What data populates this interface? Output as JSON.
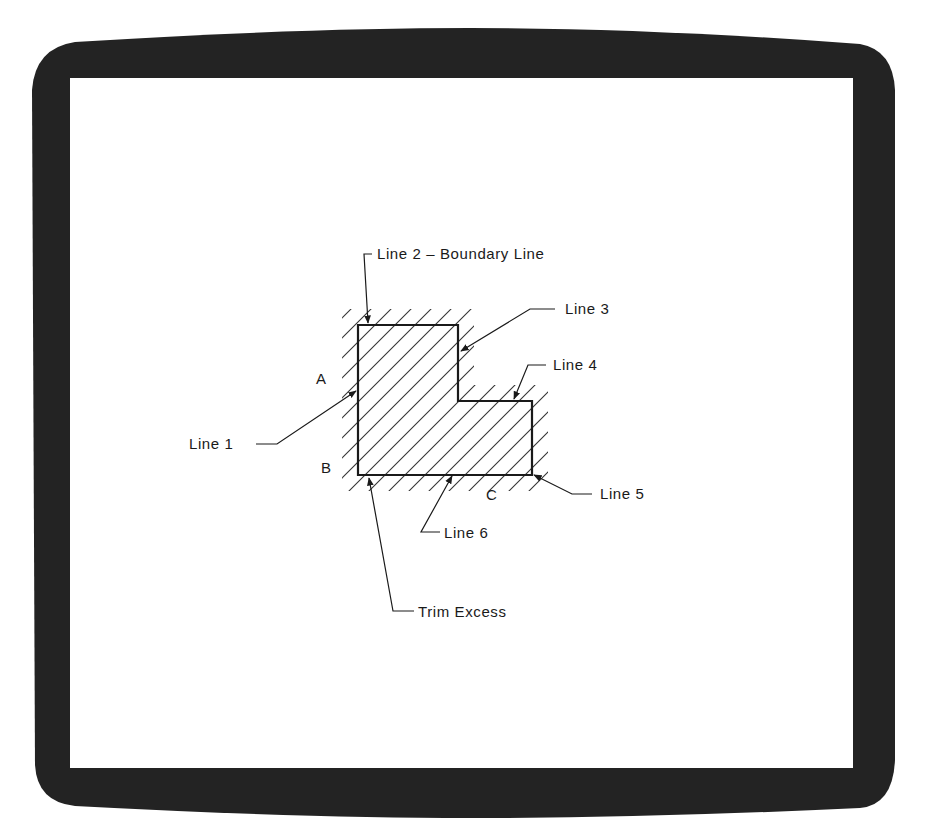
{
  "colors": {
    "frame": "#232323",
    "screen": "#ffffff",
    "ink": "#1a1a1a",
    "hatch": "#333333"
  },
  "diagram": {
    "title": "",
    "shape": {
      "description": "L-shaped boundary with diagonal hatch fill",
      "points": [
        [
          358,
          325
        ],
        [
          458,
          325
        ],
        [
          458,
          401
        ],
        [
          532,
          401
        ],
        [
          532,
          475
        ],
        [
          358,
          475
        ]
      ]
    },
    "labels": {
      "line1": "Line 1",
      "line2": "Line 2 – Boundary Line",
      "line3": "Line 3",
      "line4": "Line 4",
      "line5": "Line 5",
      "line6": "Line 6",
      "trim": "Trim Excess",
      "pointA": "A",
      "pointB": "B",
      "pointC": "C"
    }
  }
}
